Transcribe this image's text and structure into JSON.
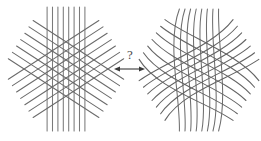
{
  "figure": {
    "caption_text": "",
    "background_color": "#ffffff",
    "line_color": "#6b6b6b",
    "line_color_dark": "#555555",
    "arrow_color": "#3a3a3a",
    "text_color": "#4a4a4a",
    "width": 261,
    "height": 141
  },
  "middle": {
    "question_label": "?",
    "arrow_name": "double-headed-arrow",
    "arrow_x_start": 114,
    "arrow_x_end": 145,
    "arrow_y": 69
  },
  "left_panel": {
    "name": "straight-line-grid",
    "center_x": 66,
    "center_y": 69,
    "families": [
      {
        "name": "vertical-lines",
        "angle_deg": 90,
        "count": 8,
        "spacing": 5.4,
        "length": 124,
        "curvature": 0,
        "color": "#7a7a7a"
      },
      {
        "name": "descending-diagonal-lines",
        "angle_deg": 33,
        "count": 7,
        "spacing": 7.6,
        "length": 108,
        "curvature": 0,
        "color": "#6b6b6b"
      },
      {
        "name": "ascending-diagonal-lines",
        "angle_deg": -33,
        "count": 7,
        "spacing": 7.6,
        "length": 108,
        "curvature": 0,
        "color": "#6b6b6b"
      }
    ]
  },
  "right_panel": {
    "name": "curved-line-grid",
    "center_x": 199,
    "center_y": 70,
    "families": [
      {
        "name": "vertical-curved-lines",
        "angle_deg": 90,
        "count": 8,
        "spacing": 5.6,
        "length": 122,
        "curvature": 26,
        "color": "#6f6f6f"
      },
      {
        "name": "descending-curved-lines",
        "angle_deg": 33,
        "count": 7,
        "spacing": 7.9,
        "length": 112,
        "curvature": 30,
        "color": "#636363"
      },
      {
        "name": "ascending-curved-lines",
        "angle_deg": -33,
        "count": 7,
        "spacing": 7.9,
        "length": 112,
        "curvature": -30,
        "color": "#636363"
      }
    ]
  },
  "chart_data": {
    "type": "diagram",
    "title": "",
    "panels": [
      {
        "id": "left",
        "label": "",
        "kind": "straight-grid",
        "line_families": 3,
        "total_lines": 22
      },
      {
        "id": "right",
        "label": "",
        "kind": "curved-grid",
        "line_families": 3,
        "total_lines": 22
      }
    ],
    "relation": {
      "symbol": "?",
      "arrow": "bidirectional"
    }
  }
}
